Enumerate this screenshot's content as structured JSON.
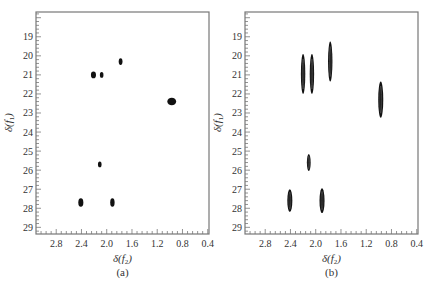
{
  "chart_data": [
    {
      "type": "scatter",
      "panel_label": "(a)",
      "title": "",
      "xlabel": "δ(f2)",
      "ylabel": "δ(f1)",
      "x_ticks": [
        "2.8",
        "2.4",
        "2.0",
        "1.6",
        "1.2",
        "0.8",
        "0.4"
      ],
      "y_ticks": [
        "19",
        "20",
        "21",
        "22",
        "23",
        "24",
        "25",
        "26",
        "27",
        "28",
        "29"
      ],
      "xlim": [
        3.12,
        0.38
      ],
      "ylim": [
        17.7,
        29.35
      ],
      "x_reversed": true,
      "y_reversed": true,
      "grid": false,
      "peaks": [
        {
          "x": 2.21,
          "y": 21.0,
          "w": 0.08,
          "h": 0.35
        },
        {
          "x": 2.08,
          "y": 21.0,
          "w": 0.05,
          "h": 0.3
        },
        {
          "x": 1.78,
          "y": 20.3,
          "w": 0.06,
          "h": 0.35
        },
        {
          "x": 0.97,
          "y": 22.4,
          "w": 0.14,
          "h": 0.4
        },
        {
          "x": 2.11,
          "y": 25.7,
          "w": 0.05,
          "h": 0.3
        },
        {
          "x": 2.41,
          "y": 27.7,
          "w": 0.08,
          "h": 0.45
        },
        {
          "x": 1.91,
          "y": 27.7,
          "w": 0.07,
          "h": 0.45
        }
      ]
    },
    {
      "type": "scatter",
      "panel_label": "(b)",
      "title": "",
      "xlabel": "δ(f2)",
      "ylabel": "δ(f1)",
      "x_ticks": [
        "2.8",
        "2.4",
        "2.0",
        "1.6",
        "1.2",
        "0.8",
        "0.4"
      ],
      "y_ticks": [
        "19",
        "20",
        "21",
        "22",
        "23",
        "24",
        "25",
        "26",
        "27",
        "28",
        "29"
      ],
      "xlim": [
        3.12,
        0.38
      ],
      "ylim": [
        17.7,
        29.35
      ],
      "x_reversed": true,
      "y_reversed": true,
      "grid": false,
      "peaks": [
        {
          "x": 2.2,
          "y": 20.95,
          "w": 0.07,
          "h": 2.1
        },
        {
          "x": 2.06,
          "y": 20.95,
          "w": 0.07,
          "h": 2.1
        },
        {
          "x": 1.77,
          "y": 20.3,
          "w": 0.07,
          "h": 2.1
        },
        {
          "x": 0.97,
          "y": 22.3,
          "w": 0.08,
          "h": 1.9
        },
        {
          "x": 2.11,
          "y": 25.6,
          "w": 0.06,
          "h": 0.9
        },
        {
          "x": 2.41,
          "y": 27.6,
          "w": 0.08,
          "h": 1.2
        },
        {
          "x": 1.9,
          "y": 27.6,
          "w": 0.08,
          "h": 1.3
        }
      ]
    }
  ],
  "labels": {
    "panel_a": "(a)",
    "panel_b": "(b)"
  }
}
